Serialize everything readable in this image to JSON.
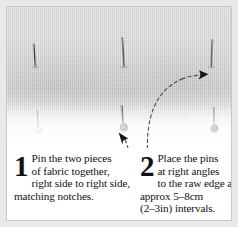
{
  "figure": {
    "background_color": "#e9e9e9",
    "card_background": "#ffffff",
    "border_color": "#c8c8c8"
  },
  "photo": {
    "description": "Close-up photograph of two layers of light grey woven fabric pinned together along a raw edge",
    "fabric_color": "#d4d4d4",
    "pins": [
      {
        "id": "upper-pin-1",
        "x": 28,
        "y": 38,
        "length": 22,
        "head": "none",
        "angle": 3
      },
      {
        "id": "upper-pin-2",
        "x": 116,
        "y": 33,
        "length": 27,
        "head": "none",
        "angle": 2
      },
      {
        "id": "upper-pin-3",
        "x": 205,
        "y": 35,
        "length": 25,
        "head": "none",
        "angle": -2
      },
      {
        "id": "lower-pin-1",
        "x": 31,
        "y": 106,
        "length": 20,
        "head": "light",
        "angle": 2
      },
      {
        "id": "lower-pin-2",
        "x": 116,
        "y": 101,
        "length": 24,
        "head": "dark",
        "angle": 1
      },
      {
        "id": "lower-pin-3",
        "x": 207,
        "y": 103,
        "length": 22,
        "head": "dark",
        "angle": 0
      }
    ],
    "annotations": [
      {
        "id": "leader-line-1",
        "target": "lower-pin-2",
        "style": "dashed",
        "arrow": "up-left"
      },
      {
        "id": "leader-line-2",
        "target": "upper-pin-3",
        "style": "dashed",
        "arrow": "right"
      }
    ]
  },
  "steps": [
    {
      "number": "1",
      "lines": [
        "Pin the two pieces",
        "of fabric together,",
        "right side to right side,",
        "matching notches."
      ]
    },
    {
      "number": "2",
      "lines": [
        "Place the pins",
        "at right angles",
        "to the raw edge at",
        "approx 5–8cm",
        "(2–3in) intervals."
      ]
    }
  ]
}
